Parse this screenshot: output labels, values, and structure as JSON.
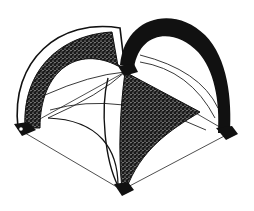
{
  "figure": {
    "description": "Line drawing of a square groin-vaulted canopy with four corner piers, viewed in isometric projection",
    "colors": {
      "ink": "#111111",
      "background": "#ffffff",
      "stipple": "#2a2a2a"
    },
    "parts": [
      "left-arch-stippled",
      "right-arch-solid",
      "front-web-stippled",
      "corner-pier-left",
      "corner-pier-front",
      "corner-pier-right",
      "corner-pier-back",
      "ground-square"
    ]
  }
}
